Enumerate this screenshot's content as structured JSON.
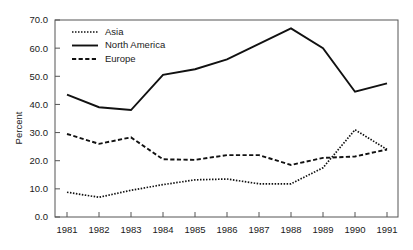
{
  "chart_data": {
    "type": "line",
    "title": "",
    "xlabel": "",
    "ylabel": "Percent",
    "categories": [
      "1981",
      "1982",
      "1983",
      "1984",
      "1985",
      "1986",
      "1987",
      "1988",
      "1989",
      "1990",
      "1991"
    ],
    "ylim": [
      0.0,
      70.0
    ],
    "yticks": [
      "0.0",
      "10.0",
      "20.0",
      "30.0",
      "40.0",
      "50.0",
      "60.0",
      "70.0"
    ],
    "ytick_values": [
      0.0,
      10.0,
      20.0,
      30.0,
      40.0,
      50.0,
      60.0,
      70.0
    ],
    "grid": false,
    "legend_position": "top-left",
    "series": [
      {
        "name": "Asia",
        "style": "dotted",
        "color": "#111111",
        "values": [
          8.8,
          7.0,
          9.5,
          11.5,
          13.2,
          13.5,
          11.8,
          11.8,
          17.5,
          31.0,
          24.0
        ]
      },
      {
        "name": "North America",
        "style": "solid",
        "color": "#111111",
        "values": [
          43.5,
          39.0,
          38.0,
          50.5,
          52.5,
          56.0,
          61.5,
          67.0,
          60.0,
          44.5,
          47.5
        ]
      },
      {
        "name": "Europe",
        "style": "dashed",
        "color": "#111111",
        "values": [
          29.5,
          26.0,
          28.3,
          20.5,
          20.3,
          22.0,
          22.0,
          18.5,
          21.0,
          21.5,
          24.0
        ]
      }
    ]
  },
  "legend": {
    "items": [
      {
        "label": "Asia",
        "style": "dotted"
      },
      {
        "label": "North America",
        "style": "solid"
      },
      {
        "label": "Europe",
        "style": "dashed"
      }
    ]
  },
  "axes": {
    "y_title": "Percent"
  }
}
